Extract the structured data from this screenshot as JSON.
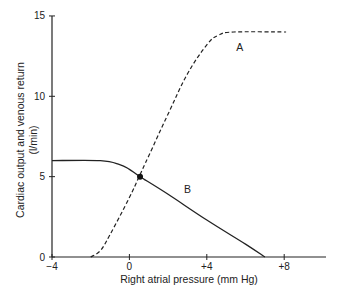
{
  "chart_data": {
    "type": "line",
    "title": "",
    "xlabel": "Right atrial pressure (mm Hg)",
    "ylabel": "Cardiac output and venous return",
    "ylabel_unit": "(l/min)",
    "xlim": [
      -4,
      11
    ],
    "ylim": [
      0,
      15
    ],
    "x_ticks": [
      -4,
      0,
      4,
      8
    ],
    "x_tick_labels": [
      "−4",
      "0",
      "+4",
      "+8"
    ],
    "y_ticks": [
      0,
      5,
      10,
      15
    ],
    "y_tick_labels": [
      "0",
      "5",
      "10",
      "15"
    ],
    "grid": false,
    "legend": "none (curves labelled directly)",
    "series": [
      {
        "name": "A",
        "description": "Cardiac output curve (dashed)",
        "style": "dashed",
        "x": [
          -2.0,
          -1.5,
          -1.0,
          0.0,
          0.5,
          1.0,
          2.0,
          3.0,
          4.0,
          4.6,
          5.4,
          8.1
        ],
        "y": [
          0.0,
          0.4,
          1.4,
          3.7,
          5.0,
          6.3,
          8.9,
          11.4,
          13.2,
          13.8,
          14.0,
          14.0
        ],
        "label_position": {
          "x": 5.7,
          "y": 12.8
        }
      },
      {
        "name": "B",
        "description": "Venous return curve (solid)",
        "style": "solid",
        "x": [
          -4.0,
          -1.5,
          -0.5,
          0.0,
          0.55,
          2.0,
          4.0,
          6.0,
          7.0
        ],
        "y": [
          6.0,
          6.0,
          5.75,
          5.45,
          5.0,
          3.9,
          2.3,
          0.8,
          0.0
        ],
        "label_position": {
          "x": 3.0,
          "y": 4.0
        }
      }
    ],
    "annotations": [
      {
        "type": "point",
        "description": "Equilibrium (intersection of A and B)",
        "x": 0.55,
        "y": 5.0
      }
    ]
  }
}
